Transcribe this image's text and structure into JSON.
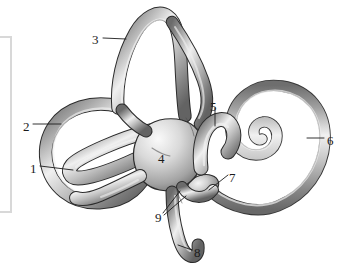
{
  "figure": {
    "name": "bony-labyrinth-inner-ear",
    "background_color": "#ffffff",
    "ink_color": "#1b1b1b",
    "structure_fill_light": "#f2f2f2",
    "structure_fill_mid": "#a9a9a9",
    "structure_fill_dark": "#595959",
    "outline_color": "#2b2b2b"
  },
  "panel": {
    "name": "left-clipped-panel",
    "border_color": "#d8d8d8",
    "fill": "#ffffff"
  },
  "labels": [
    {
      "id": "1",
      "text": "1",
      "x": 30,
      "y": 162,
      "leader": "horizontal-right"
    },
    {
      "id": "2",
      "text": "2",
      "x": 23,
      "y": 120,
      "leader": "horizontal-right"
    },
    {
      "id": "3",
      "text": "3",
      "x": 92,
      "y": 33,
      "leader": "horizontal-right"
    },
    {
      "id": "4",
      "text": "4",
      "x": 158,
      "y": 152,
      "leader": "none"
    },
    {
      "id": "5",
      "text": "5",
      "x": 210,
      "y": 100,
      "leader": "vertical-down"
    },
    {
      "id": "6",
      "text": "6",
      "x": 327,
      "y": 134,
      "leader": "horizontal-left"
    },
    {
      "id": "7",
      "text": "7",
      "x": 229,
      "y": 171,
      "leader": "diagonal-down-left"
    },
    {
      "id": "8",
      "text": "8",
      "x": 194,
      "y": 246,
      "leader": "diagonal-up-left"
    },
    {
      "id": "9",
      "text": "9",
      "x": 155,
      "y": 211,
      "leader": "double-diagonal-up-right"
    }
  ]
}
